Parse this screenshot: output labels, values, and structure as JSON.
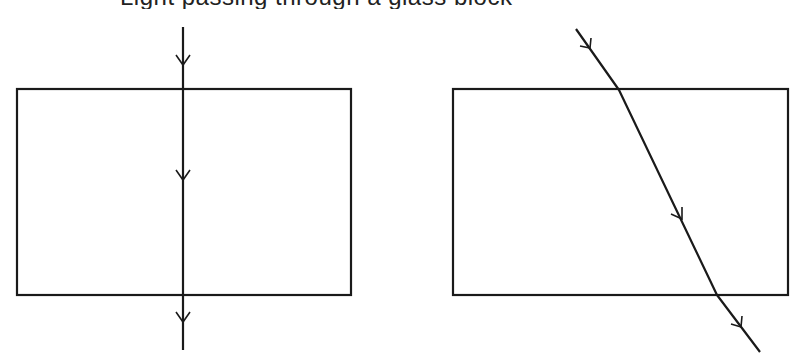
{
  "caption": {
    "text": "Light passing through a glass block",
    "visible": "descenders only (clipped at top edge)"
  },
  "colors": {
    "background": "#ffffff",
    "stroke": "#1a1a1a"
  },
  "diagrams": [
    {
      "name": "normal-incidence",
      "block": {
        "x": 17,
        "y": 89,
        "width": 334,
        "height": 206
      },
      "ray_points": [
        [
          183,
          27
        ],
        [
          183,
          89
        ],
        [
          183,
          295
        ],
        [
          183,
          350
        ]
      ],
      "arrows": [
        [
          183,
          65
        ],
        [
          183,
          180
        ],
        [
          183,
          322
        ]
      ]
    },
    {
      "name": "oblique-incidence-refraction",
      "block": {
        "x": 453,
        "y": 89,
        "width": 335,
        "height": 206
      },
      "ray_points": [
        [
          576,
          29
        ],
        [
          619,
          90
        ],
        [
          717,
          295
        ],
        [
          760,
          352
        ]
      ],
      "arrows": [
        [
          590,
          48
        ],
        [
          682,
          219
        ],
        [
          741,
          327
        ]
      ]
    }
  ]
}
